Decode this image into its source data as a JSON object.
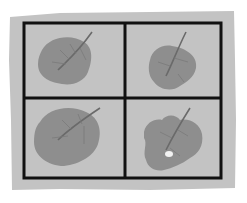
{
  "illustration": {
    "description": "Four leaves in a 2x2 grid on a gray paper card",
    "colors": {
      "background": "#ffffff",
      "paper": "#c3c3c3",
      "grid_line": "#111111",
      "leaf": "#8e8e8e",
      "leaf_shade": "#7c7c7c",
      "vein": "#6a6a6a",
      "hole": "#f2f2f2"
    },
    "cells": [
      {
        "position": "top-left",
        "leaf": "round-leaf"
      },
      {
        "position": "top-right",
        "leaf": "small-leaf"
      },
      {
        "position": "bottom-left",
        "leaf": "large-leaf"
      },
      {
        "position": "bottom-right",
        "leaf": "eaten-leaf-with-hole"
      }
    ]
  }
}
